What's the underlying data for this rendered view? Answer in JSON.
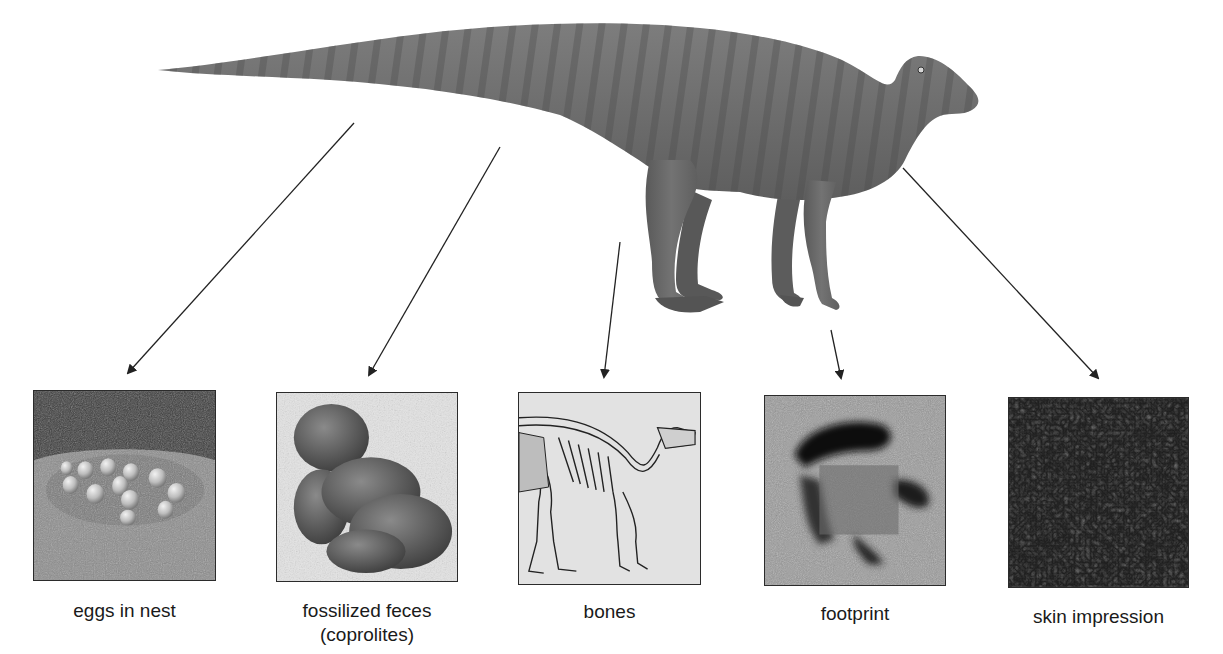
{
  "figure": {
    "subject_icon": "dinosaur-illustration-icon",
    "colors": {
      "background": "#ffffff",
      "dinosaur_body": "#6f6f6f",
      "dinosaur_stripes": "#4a4a4a",
      "arrow": "#222222",
      "panel_border": "#2b2b2b",
      "caption_text": "#1a1a1a"
    }
  },
  "panels": [
    {
      "id": "eggs",
      "icon": "eggs-in-nest-image",
      "caption_line1": "eggs in nest",
      "caption_line2": ""
    },
    {
      "id": "coprolites",
      "icon": "coprolite-image",
      "caption_line1": "fossilized feces",
      "caption_line2": "(coprolites)"
    },
    {
      "id": "bones",
      "icon": "skeleton-image",
      "caption_line1": "bones",
      "caption_line2": ""
    },
    {
      "id": "footprint",
      "icon": "footprint-image",
      "caption_line1": "footprint",
      "caption_line2": ""
    },
    {
      "id": "skin",
      "icon": "skin-impression-image",
      "caption_line1": "skin impression",
      "caption_line2": ""
    }
  ],
  "arrows": [
    {
      "from": [
        354,
        123
      ],
      "to": [
        128,
        373
      ],
      "target": "eggs"
    },
    {
      "from": [
        500,
        147
      ],
      "to": [
        369,
        375
      ],
      "target": "coprolites"
    },
    {
      "from": [
        620,
        242
      ],
      "to": [
        604,
        377
      ],
      "target": "bones"
    },
    {
      "from": [
        831,
        330
      ],
      "to": [
        841,
        378
      ],
      "target": "footprint"
    },
    {
      "from": [
        903,
        168
      ],
      "to": [
        1098,
        378
      ],
      "target": "skin"
    }
  ]
}
